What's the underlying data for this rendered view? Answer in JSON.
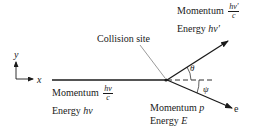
{
  "diagram": {
    "axes": {
      "x_label": "x",
      "y_label": "y"
    },
    "collision_label": "Collision site",
    "incident_photon": {
      "momentum_label": "Momentum",
      "momentum_num": "hν",
      "momentum_den": "c",
      "energy_label": "Energy",
      "energy_value": "hν"
    },
    "scattered_photon": {
      "momentum_label": "Momentum",
      "momentum_num": "hν′",
      "momentum_den": "c",
      "energy_label": "Energy",
      "energy_value": "hν′"
    },
    "electron": {
      "momentum_label": "Momentum",
      "momentum_value": "p",
      "energy_label": "Energy",
      "energy_value": "E",
      "tag": "e"
    },
    "angles": {
      "photon": "θ",
      "electron": "ψ"
    }
  }
}
